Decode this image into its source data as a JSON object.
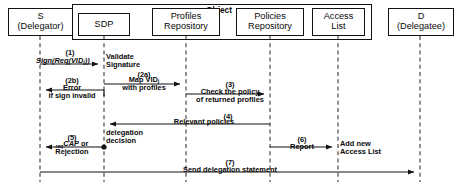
{
  "diagram": {
    "type": "uml-sequence-diagram",
    "group": {
      "label": "Object",
      "members": [
        "SDP",
        "Profiles Repository",
        "Policies Repository",
        "Access List"
      ]
    },
    "participants": [
      {
        "id": "s",
        "name": "S",
        "role": "(Delegator)",
        "x": 40,
        "box": {
          "left": 8,
          "top": 8,
          "width": 65,
          "height": 28
        }
      },
      {
        "id": "sdp",
        "name": "SDP",
        "role": "",
        "x": 104,
        "box": {
          "left": 78,
          "top": 13,
          "width": 52,
          "height": 23
        }
      },
      {
        "id": "profiles",
        "name": "Profiles",
        "role": "Repository",
        "x": 186,
        "box": {
          "left": 152,
          "top": 8,
          "width": 68,
          "height": 28
        }
      },
      {
        "id": "policies",
        "name": "Policies",
        "role": "Repository",
        "x": 270,
        "box": {
          "left": 236,
          "top": 8,
          "width": 68,
          "height": 28
        }
      },
      {
        "id": "access",
        "name": "Access",
        "role": "List",
        "x": 338,
        "box": {
          "left": 312,
          "top": 8,
          "width": 53,
          "height": 28
        }
      },
      {
        "id": "d",
        "name": "D",
        "role": "(Delegatee)",
        "x": 420,
        "box": {
          "left": 388,
          "top": 8,
          "width": 66,
          "height": 28
        }
      }
    ],
    "messages": [
      {
        "number": "(1)",
        "label": "Sign(Req(VIDj))",
        "from": "s",
        "to": "sdp",
        "direction": "right",
        "y": 64,
        "style": "solid"
      },
      {
        "number": "",
        "label": "Validate Signature",
        "from": "sdp",
        "to": "sdp",
        "direction": "self-note",
        "y": 60,
        "style": "note"
      },
      {
        "number": "(2a)",
        "label": "Map VIDj with profiles",
        "from": "sdp",
        "to": "profiles",
        "direction": "right",
        "y": 84,
        "style": "solid"
      },
      {
        "number": "(2b)",
        "label": "Error if sign invalid",
        "from": "sdp",
        "to": "s",
        "direction": "left",
        "y": 90,
        "style": "solid"
      },
      {
        "number": "(3)",
        "label": "Check the policy of returned profiles",
        "from": "profiles",
        "to": "policies",
        "direction": "right",
        "y": 94,
        "style": "solid"
      },
      {
        "number": "(4)",
        "label": "Relevant policies",
        "from": "policies",
        "to": "sdp",
        "direction": "left",
        "y": 124,
        "style": "solid"
      },
      {
        "number": "(5)",
        "label": "reqCAP or Rejection",
        "from": "sdp",
        "to": "s",
        "direction": "left",
        "y": 147,
        "style": "solid",
        "note": "delegation decision"
      },
      {
        "number": "(6)",
        "label": "Report",
        "from": "policies",
        "to": "access",
        "direction": "right",
        "y": 147,
        "style": "solid",
        "note": "Add new Access List"
      },
      {
        "number": "(7)",
        "label": "Send delegation statement",
        "from": "s",
        "to": "d",
        "direction": "right",
        "y": 172,
        "style": "solid"
      }
    ],
    "annotations": {
      "validate_line1": "Validate",
      "validate_line2": "Signature",
      "error_line1": "Error",
      "error_line2": "if sign invalid",
      "map_line1": "Map VID",
      "map_sub": "j",
      "map_line2": "with profiles",
      "check_line1": "Check the policy",
      "check_line2": "of returned profiles",
      "relevant": "Relevant policies",
      "delegation_line1": "delegation",
      "delegation_line2": "decision",
      "cap_pre": "req",
      "cap_main": "CAP",
      "cap_or": " or",
      "cap_line2": "Rejection",
      "report": "Report",
      "addnew_line1": "Add new",
      "addnew_line2": "Access List",
      "send": "Send delegation statement",
      "sign_main": "Sign(Req(VID",
      "sign_sub": "j",
      "sign_tail": "))"
    },
    "numbers": {
      "n1": "(1)",
      "n2a": "(2a)",
      "n2b": "(2b)",
      "n3": "(3)",
      "n4": "(4)",
      "n5": "(5)",
      "n6": "(6)",
      "n7": "(7)"
    },
    "colors": {
      "stroke": "#111111",
      "text": "#0a0a0a",
      "background": "#ffffff",
      "lifeline": "#3a3a3a"
    }
  }
}
